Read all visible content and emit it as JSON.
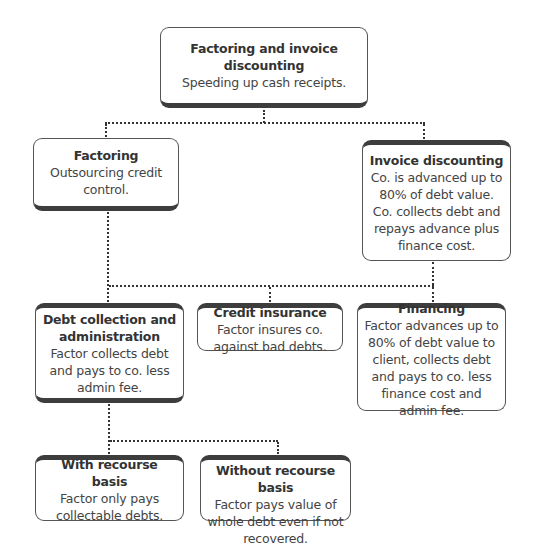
{
  "root": {
    "title": "Factoring and invoice discounting",
    "desc": "Speeding up cash receipts."
  },
  "level1": [
    {
      "title": "Factoring",
      "desc": "Outsourcing credit control."
    },
    {
      "title": "Invoice discounting",
      "desc": "Co. is advanced up to 80% of debt value. Co. collects debt and repays advance plus finance cost."
    }
  ],
  "level2": [
    {
      "title": "Debt collection and administration",
      "desc": "Factor collects debt and pays to co. less admin fee."
    },
    {
      "title": "Credit insurance",
      "desc": "Factor insures co. against bad debts."
    },
    {
      "title": "Financing",
      "desc": "Factor advances up to 80% of debt value to client, collects debt and pays to co. less finance cost and admin fee."
    }
  ],
  "level3": [
    {
      "title": "With recourse basis",
      "desc": "Factor only pays collectable debts."
    },
    {
      "title": "Without recourse basis",
      "desc": "Factor pays value of whole debt even if not recovered."
    }
  ]
}
